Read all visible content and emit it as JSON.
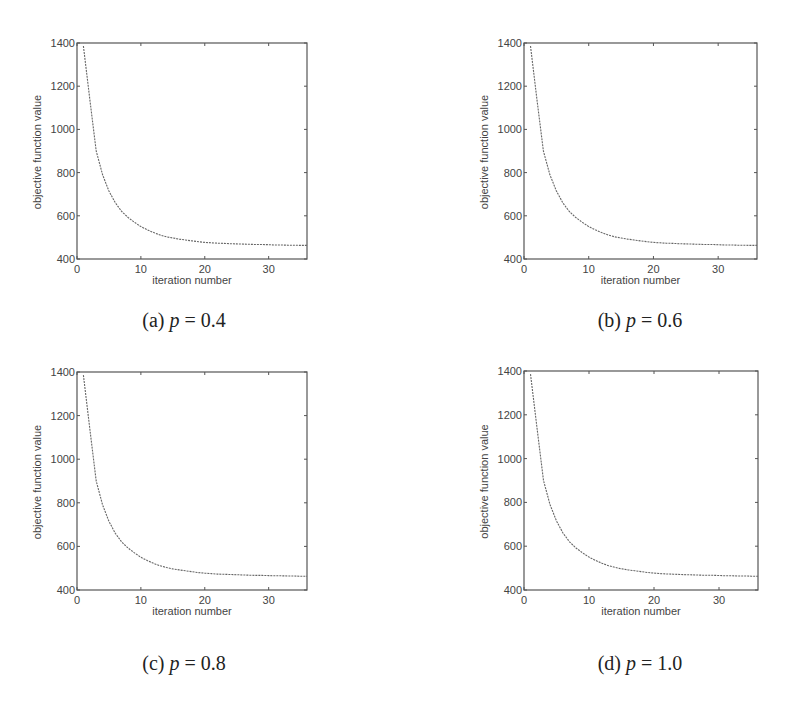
{
  "figure": {
    "panels": [
      {
        "id": "a",
        "caption_prefix": "(a)",
        "caption_var": "p",
        "caption_eq": "=",
        "caption_value": "0.4"
      },
      {
        "id": "b",
        "caption_prefix": "(b)",
        "caption_var": "p",
        "caption_eq": "=",
        "caption_value": "0.6"
      },
      {
        "id": "c",
        "caption_prefix": "(c)",
        "caption_var": "p",
        "caption_eq": "=",
        "caption_value": "0.8"
      },
      {
        "id": "d",
        "caption_prefix": "(d)",
        "caption_var": "p",
        "caption_eq": "=",
        "caption_value": "1.0"
      }
    ]
  },
  "chart_data": [
    {
      "type": "line",
      "panel": "(a) p = 0.4",
      "title": "",
      "xlabel": "iteration number",
      "ylabel": "objective function value",
      "xlim": [
        0,
        36
      ],
      "ylim": [
        400,
        1400
      ],
      "xticks": [
        0,
        10,
        20,
        30
      ],
      "yticks": [
        400,
        600,
        800,
        1000,
        1200,
        1400
      ],
      "grid": false,
      "legend": null,
      "series": [
        {
          "name": "objective",
          "style": "dotted",
          "x": [
            1,
            2,
            3,
            4,
            5,
            6,
            7,
            8,
            9,
            10,
            11,
            12,
            13,
            14,
            15,
            16,
            17,
            18,
            19,
            20,
            21,
            22,
            23,
            24,
            25,
            26,
            27,
            28,
            29,
            30,
            31,
            32,
            33,
            34,
            35,
            36
          ],
          "values": [
            1386,
            1140,
            900,
            790,
            715,
            660,
            620,
            592,
            570,
            550,
            535,
            522,
            511,
            503,
            497,
            492,
            488,
            484,
            480,
            477,
            475,
            473,
            472,
            471,
            470,
            469,
            468,
            467,
            467,
            466,
            465,
            465,
            464,
            464,
            463,
            463
          ]
        }
      ]
    },
    {
      "type": "line",
      "panel": "(b) p = 0.6",
      "title": "",
      "xlabel": "iteration number",
      "ylabel": "objective function value",
      "xlim": [
        0,
        36
      ],
      "ylim": [
        400,
        1400
      ],
      "xticks": [
        0,
        10,
        20,
        30
      ],
      "yticks": [
        400,
        600,
        800,
        1000,
        1200,
        1400
      ],
      "grid": false,
      "legend": null,
      "series": [
        {
          "name": "objective",
          "style": "dotted",
          "x": [
            1,
            2,
            3,
            4,
            5,
            6,
            7,
            8,
            9,
            10,
            11,
            12,
            13,
            14,
            15,
            16,
            17,
            18,
            19,
            20,
            21,
            22,
            23,
            24,
            25,
            26,
            27,
            28,
            29,
            30,
            31,
            32,
            33,
            34,
            35,
            36
          ],
          "values": [
            1386,
            1140,
            900,
            790,
            715,
            660,
            620,
            592,
            570,
            550,
            535,
            522,
            511,
            503,
            497,
            492,
            488,
            484,
            480,
            477,
            475,
            473,
            472,
            471,
            470,
            469,
            468,
            467,
            467,
            466,
            465,
            465,
            464,
            464,
            463,
            463
          ]
        }
      ]
    },
    {
      "type": "line",
      "panel": "(c) p = 0.8",
      "title": "",
      "xlabel": "iteration number",
      "ylabel": "objective function value",
      "xlim": [
        0,
        36
      ],
      "ylim": [
        400,
        1400
      ],
      "xticks": [
        0,
        10,
        20,
        30
      ],
      "yticks": [
        400,
        600,
        800,
        1000,
        1200,
        1400
      ],
      "grid": false,
      "legend": null,
      "series": [
        {
          "name": "objective",
          "style": "dotted",
          "x": [
            1,
            2,
            3,
            4,
            5,
            6,
            7,
            8,
            9,
            10,
            11,
            12,
            13,
            14,
            15,
            16,
            17,
            18,
            19,
            20,
            21,
            22,
            23,
            24,
            25,
            26,
            27,
            28,
            29,
            30,
            31,
            32,
            33,
            34,
            35,
            36
          ],
          "values": [
            1386,
            1140,
            900,
            790,
            715,
            660,
            620,
            592,
            570,
            550,
            535,
            522,
            511,
            503,
            497,
            492,
            488,
            484,
            480,
            477,
            475,
            473,
            472,
            471,
            470,
            469,
            468,
            467,
            467,
            466,
            465,
            465,
            464,
            464,
            463,
            463
          ]
        }
      ]
    },
    {
      "type": "line",
      "panel": "(d) p = 1.0",
      "title": "",
      "xlabel": "iteration number",
      "ylabel": "objective function value",
      "xlim": [
        0,
        36
      ],
      "ylim": [
        400,
        1400
      ],
      "xticks": [
        0,
        10,
        20,
        30
      ],
      "yticks": [
        400,
        600,
        800,
        1000,
        1200,
        1400
      ],
      "grid": false,
      "legend": null,
      "series": [
        {
          "name": "objective",
          "style": "dotted",
          "x": [
            1,
            2,
            3,
            4,
            5,
            6,
            7,
            8,
            9,
            10,
            11,
            12,
            13,
            14,
            15,
            16,
            17,
            18,
            19,
            20,
            21,
            22,
            23,
            24,
            25,
            26,
            27,
            28,
            29,
            30,
            31,
            32,
            33,
            34,
            35,
            36
          ],
          "values": [
            1386,
            1140,
            900,
            790,
            715,
            660,
            620,
            592,
            570,
            550,
            535,
            522,
            511,
            503,
            497,
            492,
            488,
            484,
            480,
            477,
            475,
            473,
            472,
            471,
            470,
            469,
            468,
            467,
            467,
            466,
            465,
            465,
            464,
            464,
            463,
            463
          ]
        }
      ]
    }
  ],
  "style": {
    "axis_color": "#555555",
    "line_color": "#666666",
    "text_color": "#444444"
  }
}
